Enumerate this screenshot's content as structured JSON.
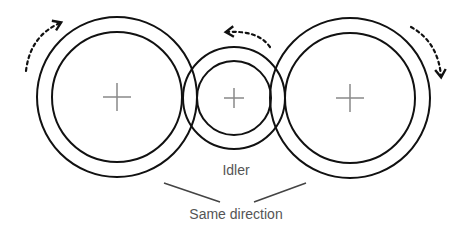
{
  "diagram": {
    "gears": [
      {
        "id": "left",
        "role": "driver gear",
        "rotation": "clockwise"
      },
      {
        "id": "idler",
        "role": "idler gear",
        "rotation": "counter-clockwise"
      },
      {
        "id": "right",
        "role": "driven gear",
        "rotation": "clockwise"
      }
    ],
    "labels": {
      "idler": "Idler",
      "same_direction": "Same direction"
    },
    "colors": {
      "stroke": "#111111",
      "center_mark": "#888888",
      "text": "#555555",
      "pointer_line": "#444444"
    }
  }
}
